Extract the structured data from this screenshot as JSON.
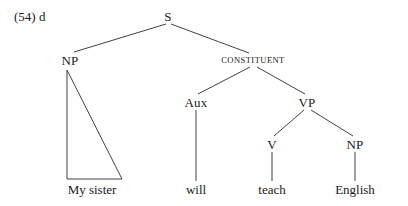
{
  "figure": {
    "example_tag": "(54) d",
    "example_tag_x": 14,
    "example_tag_y": 16,
    "width": 408,
    "height": 206,
    "background": "#ffffff",
    "line_color": "#2b2b2b",
    "text_color": "#1a1a1a"
  },
  "diagram_data": {
    "type": "syntax-tree",
    "sentence": "My sister will teach English",
    "nodes": [
      {
        "id": "S",
        "label": "S",
        "x": 168,
        "y": 16,
        "style": "normal"
      },
      {
        "id": "NP1",
        "label": "NP",
        "x": 70,
        "y": 60,
        "style": "normal"
      },
      {
        "id": "CONSTITUENT",
        "label": "CONSTITUENT",
        "x": 253,
        "y": 60,
        "style": "smallcaps"
      },
      {
        "id": "Aux",
        "label": "Aux",
        "x": 196,
        "y": 102,
        "style": "normal"
      },
      {
        "id": "VP",
        "label": "VP",
        "x": 307,
        "y": 102,
        "style": "normal"
      },
      {
        "id": "V",
        "label": "V",
        "x": 272,
        "y": 144,
        "style": "normal"
      },
      {
        "id": "NP2",
        "label": "NP",
        "x": 355,
        "y": 144,
        "style": "normal"
      }
    ],
    "terminals": [
      {
        "id": "t-my-sister",
        "label": "My sister",
        "x": 92,
        "y": 189
      },
      {
        "id": "t-will",
        "label": "will",
        "x": 196,
        "y": 189
      },
      {
        "id": "t-teach",
        "label": "teach",
        "x": 272,
        "y": 189
      },
      {
        "id": "t-english",
        "label": "English",
        "x": 355,
        "y": 189
      }
    ],
    "edges": [
      {
        "id": "e-s-np",
        "from": "S",
        "to": "NP1",
        "x1": 166,
        "y1": 24,
        "x2": 74,
        "y2": 52
      },
      {
        "id": "e-s-constituent",
        "from": "S",
        "to": "CONSTITUENT",
        "x1": 171,
        "y1": 24,
        "x2": 249,
        "y2": 53
      },
      {
        "id": "e-constituent-aux",
        "from": "CONSTITUENT",
        "to": "Aux",
        "x1": 250,
        "y1": 67,
        "x2": 198,
        "y2": 94
      },
      {
        "id": "e-constituent-vp",
        "from": "CONSTITUENT",
        "to": "VP",
        "x1": 257,
        "y1": 67,
        "x2": 305,
        "y2": 94
      },
      {
        "id": "e-aux-will",
        "from": "Aux",
        "to": "t-will",
        "x1": 196,
        "y1": 110,
        "x2": 196,
        "y2": 181
      },
      {
        "id": "e-vp-v",
        "from": "VP",
        "to": "V",
        "x1": 304,
        "y1": 110,
        "x2": 274,
        "y2": 136
      },
      {
        "id": "e-vp-np",
        "from": "VP",
        "to": "NP2",
        "x1": 311,
        "y1": 110,
        "x2": 353,
        "y2": 136
      },
      {
        "id": "e-v-teach",
        "from": "V",
        "to": "t-teach",
        "x1": 272,
        "y1": 152,
        "x2": 272,
        "y2": 181
      },
      {
        "id": "e-np2-english",
        "from": "NP2",
        "to": "t-english",
        "x1": 355,
        "y1": 152,
        "x2": 355,
        "y2": 181
      }
    ],
    "triangles": [
      {
        "id": "tri-np1",
        "over": "NP1",
        "covers": "My sister",
        "points": "67,70 67,179 122,179 67,70"
      }
    ]
  }
}
